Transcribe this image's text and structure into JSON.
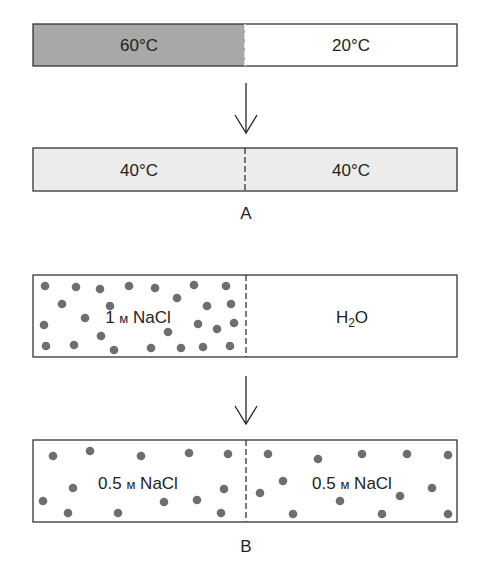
{
  "colors": {
    "hot": "#a8a8a8",
    "warm": "#ececec",
    "cold": "#ffffff",
    "stroke": "#333333",
    "dot": "#6e6e6e"
  },
  "panel_a": {
    "label": "A",
    "before": {
      "left": "60°C",
      "right": "20°C"
    },
    "after": {
      "left": "40°C",
      "right": "40°C"
    }
  },
  "panel_b": {
    "label": "B",
    "before": {
      "left_prefix": "1 ",
      "left_unit": "м",
      "left_suffix": " NaCl",
      "right_h": "H",
      "right_sub": "2",
      "right_o": "O"
    },
    "after": {
      "left_prefix": "0.5 ",
      "left_unit": "м",
      "left_suffix": " NaCl",
      "right_prefix": "0.5 ",
      "right_unit": "м",
      "right_suffix": " NaCl"
    },
    "dots_before": [
      [
        45,
        286
      ],
      [
        76,
        287
      ],
      [
        100,
        289
      ],
      [
        129,
        286
      ],
      [
        155,
        288
      ],
      [
        194,
        285
      ],
      [
        226,
        286
      ],
      [
        62,
        304
      ],
      [
        110,
        306
      ],
      [
        177,
        298
      ],
      [
        207,
        306
      ],
      [
        231,
        304
      ],
      [
        85,
        318
      ],
      [
        44,
        325
      ],
      [
        198,
        324
      ],
      [
        217,
        329
      ],
      [
        234,
        323
      ],
      [
        101,
        336
      ],
      [
        168,
        332
      ],
      [
        46,
        346
      ],
      [
        74,
        345
      ],
      [
        114,
        350
      ],
      [
        151,
        348
      ],
      [
        181,
        348
      ],
      [
        203,
        347
      ],
      [
        230,
        346
      ]
    ],
    "dots_after": [
      [
        53,
        456
      ],
      [
        90,
        451
      ],
      [
        141,
        456
      ],
      [
        189,
        453
      ],
      [
        228,
        454
      ],
      [
        73,
        488
      ],
      [
        43,
        501
      ],
      [
        68,
        513
      ],
      [
        118,
        513
      ],
      [
        164,
        502
      ],
      [
        197,
        500
      ],
      [
        224,
        489
      ],
      [
        221,
        513
      ],
      [
        268,
        454
      ],
      [
        318,
        459
      ],
      [
        362,
        454
      ],
      [
        407,
        454
      ],
      [
        448,
        455
      ],
      [
        283,
        481
      ],
      [
        260,
        493
      ],
      [
        340,
        501
      ],
      [
        400,
        496
      ],
      [
        432,
        488
      ],
      [
        293,
        514
      ],
      [
        382,
        514
      ],
      [
        448,
        514
      ]
    ]
  }
}
